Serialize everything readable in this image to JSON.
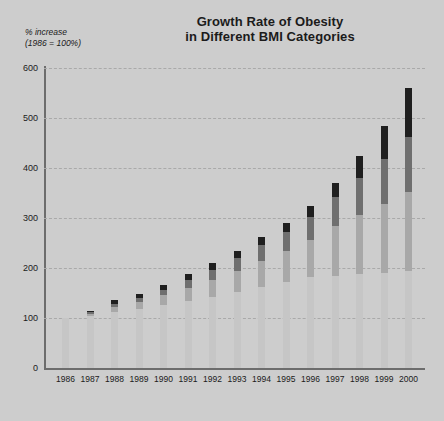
{
  "chart": {
    "title_line1": "Growth Rate of Obesity",
    "title_line2": "in Different BMI Categories",
    "ycaption_line1": "% increase",
    "ycaption_line2": "(1986 = 100%)"
  },
  "chart_data": {
    "type": "bar",
    "stacked": true,
    "title": "Growth Rate of Obesity in Different BMI Categories",
    "xlabel": "",
    "ylabel": "% increase (1986 = 100%)",
    "ylim": [
      0,
      600
    ],
    "yticks": [
      0,
      100,
      200,
      300,
      400,
      500,
      600
    ],
    "grid": true,
    "grid_axis": "y",
    "legend": "none",
    "categories": [
      "1986",
      "1987",
      "1988",
      "1989",
      "1990",
      "1991",
      "1992",
      "1993",
      "1994",
      "1995",
      "1996",
      "1997",
      "1998",
      "1999",
      "2000"
    ],
    "series": [
      {
        "name": "BMI 30-35",
        "color": "#c6c6c6",
        "values": [
          100,
          105,
          112,
          118,
          126,
          134,
          143,
          152,
          162,
          172,
          182,
          185,
          188,
          191,
          195
        ]
      },
      {
        "name": "BMI 35-40",
        "color": "#a8a8a8",
        "values": [
          0,
          4,
          10,
          14,
          20,
          26,
          34,
          42,
          52,
          62,
          74,
          100,
          118,
          138,
          158
        ]
      },
      {
        "name": "BMI 40-45",
        "color": "#6f6f6f",
        "values": [
          0,
          3,
          7,
          8,
          10,
          16,
          20,
          26,
          32,
          38,
          46,
          58,
          75,
          90,
          110
        ]
      },
      {
        "name": "BMI 45+",
        "color": "#1f1f1f",
        "values": [
          0,
          3,
          8,
          9,
          10,
          12,
          13,
          15,
          16,
          18,
          22,
          27,
          44,
          66,
          97
        ]
      }
    ],
    "totals": [
      100,
      115,
      137,
      149,
      166,
      188,
      210,
      235,
      262,
      290,
      324,
      370,
      425,
      485,
      560
    ],
    "axis_color": "#6d6d6d",
    "grid_color": "#a9a9a9",
    "background": "#cdcdcd",
    "plot_background": "#d2d2d2"
  }
}
